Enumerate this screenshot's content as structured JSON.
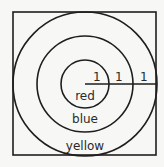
{
  "diagram": {
    "type": "concentric-circles-in-square",
    "radius_labels": [
      "1",
      "1",
      "1"
    ],
    "region_labels": {
      "inner": "red",
      "middle": "blue",
      "outer": "yellow"
    },
    "colors": {
      "stroke": "#1e1e1e",
      "background": "#f7f7f5",
      "text": "#2a2a2a"
    }
  }
}
